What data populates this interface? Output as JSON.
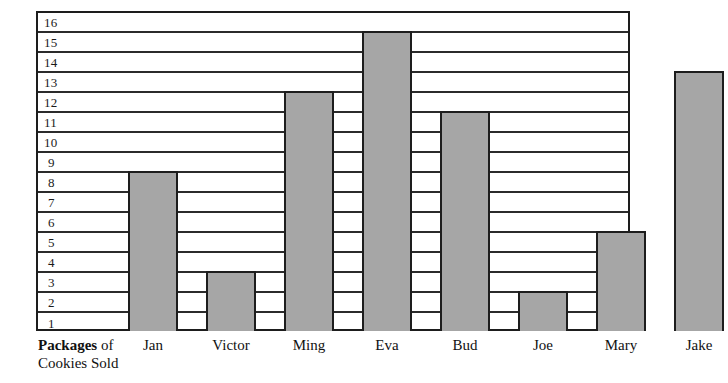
{
  "chart_data": {
    "type": "bar",
    "title": "",
    "xlabel": "Packages of Cookies Sold",
    "ylabel": "",
    "categories": [
      "Jan",
      "Victor",
      "Ming",
      "Eva",
      "Bud",
      "Joe",
      "Mary",
      "Jake"
    ],
    "values": [
      8,
      3,
      12,
      15,
      11,
      2,
      5,
      13
    ],
    "ylim": [
      0,
      16
    ],
    "y_ticks": [
      16,
      15,
      14,
      13,
      12,
      11,
      10,
      9,
      8,
      7,
      6,
      5,
      4,
      3,
      2,
      1
    ],
    "grid": true,
    "legend": null,
    "bar_color": "#a6a6a6",
    "frame_color": "#1d1d1d",
    "gridline_color": "#2b2b2b"
  },
  "axis": {
    "caption_strong": "Packages",
    "caption_rest": " of",
    "caption_line2": "Cookies Sold"
  }
}
